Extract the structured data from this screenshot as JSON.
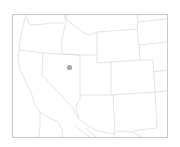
{
  "map": {
    "region": "Western United States",
    "style": "state borders outline",
    "colors": {
      "background": "#ffffff",
      "frame": "#c8c8c8",
      "borders": "#d6d6d6",
      "marker": "#a9a9a9"
    },
    "states_visible": [
      "Washington",
      "Oregon",
      "California",
      "Nevada",
      "Idaho",
      "Montana",
      "Wyoming",
      "Utah",
      "Colorado",
      "Arizona",
      "New Mexico",
      "North Dakota",
      "South Dakota",
      "Nebraska",
      "Kansas",
      "Oklahoma",
      "Texas",
      "Mexico (partial)"
    ],
    "markers": [
      {
        "label": "",
        "location": "Northern Nevada",
        "approx_lat": 40.3,
        "approx_lon": -116.3
      }
    ]
  }
}
